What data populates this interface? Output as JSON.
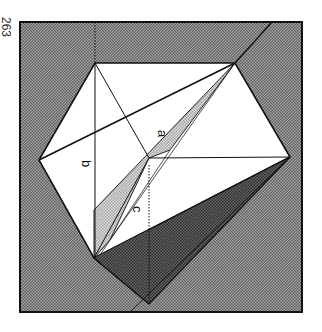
{
  "page_number": "263",
  "figure": {
    "labels": {
      "a": "a",
      "b": "b",
      "c": "c"
    },
    "colors": {
      "background_hatch_dark": "#8a8a8a",
      "light_shade": "#c8c8c8",
      "dark_shade": "#555555",
      "paper": "#ffffff",
      "line": "#111111"
    },
    "vertices": {
      "top_left": [
        95,
        63
      ],
      "top_right": [
        235,
        63
      ],
      "left": [
        39,
        160
      ],
      "right": [
        290,
        157
      ],
      "bottom_left": [
        94,
        258
      ],
      "bottom_apex": [
        149,
        304
      ],
      "center": [
        149,
        158
      ]
    }
  }
}
